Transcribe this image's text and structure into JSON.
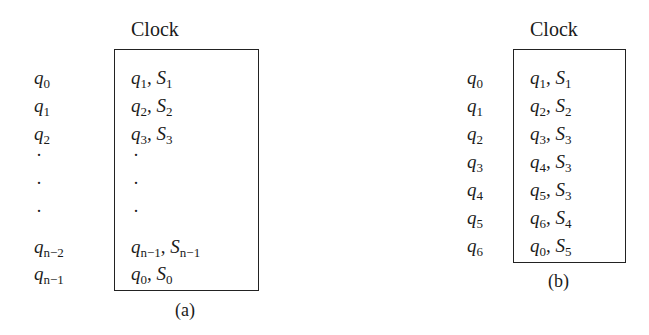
{
  "diagram_a": {
    "title": "Clock",
    "caption": "(a)",
    "rows": [
      {
        "state": "q",
        "state_sub": "0",
        "next": "q",
        "next_sub": "1",
        "out": "S",
        "out_sub": "1"
      },
      {
        "state": "q",
        "state_sub": "1",
        "next": "q",
        "next_sub": "2",
        "out": "S",
        "out_sub": "2"
      },
      {
        "state": "q",
        "state_sub": "2",
        "next": "q",
        "next_sub": "3",
        "out": "S",
        "out_sub": "3"
      },
      {
        "ellipsis": "·"
      },
      {
        "ellipsis": "·"
      },
      {
        "ellipsis": "·"
      },
      {
        "state": "q",
        "state_sub": "n−2",
        "next": "q",
        "next_sub": "n−1",
        "out": "S",
        "out_sub": "n−1"
      },
      {
        "state": "q",
        "state_sub": "n−1",
        "next": "q",
        "next_sub": "0",
        "out": "S",
        "out_sub": "0"
      }
    ]
  },
  "diagram_b": {
    "title": "Clock",
    "caption": "(b)",
    "rows": [
      {
        "state": "q",
        "state_sub": "0",
        "next": "q",
        "next_sub": "1",
        "out": "S",
        "out_sub": "1"
      },
      {
        "state": "q",
        "state_sub": "1",
        "next": "q",
        "next_sub": "2",
        "out": "S",
        "out_sub": "2"
      },
      {
        "state": "q",
        "state_sub": "2",
        "next": "q",
        "next_sub": "3",
        "out": "S",
        "out_sub": "3"
      },
      {
        "state": "q",
        "state_sub": "3",
        "next": "q",
        "next_sub": "4",
        "out": "S",
        "out_sub": "3"
      },
      {
        "state": "q",
        "state_sub": "4",
        "next": "q",
        "next_sub": "5",
        "out": "S",
        "out_sub": "3"
      },
      {
        "state": "q",
        "state_sub": "5",
        "next": "q",
        "next_sub": "6",
        "out": "S",
        "out_sub": "4"
      },
      {
        "state": "q",
        "state_sub": "6",
        "next": "q",
        "next_sub": "0",
        "out": "S",
        "out_sub": "5"
      }
    ]
  }
}
